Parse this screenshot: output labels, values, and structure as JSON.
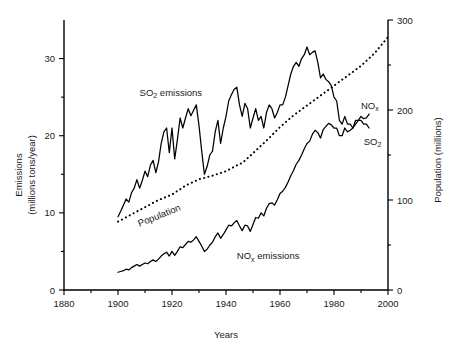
{
  "chart_data": {
    "type": "line",
    "title": "",
    "xlabel": "Years",
    "ylabel": "Emissions\n(millions tons/year)",
    "y2label": "Population (millions)",
    "xlim": [
      1880,
      2000
    ],
    "ylim": [
      0,
      35
    ],
    "y2lim": [
      0,
      300
    ],
    "grid": false,
    "legend_position": "inline-annotations",
    "x_ticks": [
      1880,
      1900,
      1920,
      1940,
      1960,
      1980,
      2000
    ],
    "x_tick_labels": [
      "1880",
      "1900",
      "1920",
      "1940",
      "1960",
      "1980",
      "2000"
    ],
    "x_minor_ticks": [
      1890,
      1910,
      1930,
      1950,
      1970,
      1990
    ],
    "y_ticks": [
      0,
      10,
      20,
      30
    ],
    "y_tick_labels": [
      "0",
      "10",
      "20",
      "30"
    ],
    "y_minor_ticks": [
      5,
      15,
      25
    ],
    "y2_ticks": [
      0,
      100,
      200,
      300
    ],
    "y2_tick_labels": [
      "0",
      "100",
      "200",
      "300"
    ],
    "y2_minor_ticks": [
      50,
      150,
      250
    ],
    "series": [
      {
        "name": "SO2 emissions",
        "label": "SO₂ emissions",
        "axis": "left",
        "style": "solid",
        "units": "millions tons/year",
        "x": [
          1900,
          1901,
          1902,
          1903,
          1904,
          1905,
          1906,
          1907,
          1908,
          1909,
          1910,
          1911,
          1912,
          1913,
          1914,
          1915,
          1916,
          1917,
          1918,
          1919,
          1920,
          1921,
          1922,
          1923,
          1924,
          1925,
          1926,
          1927,
          1928,
          1929,
          1930,
          1931,
          1932,
          1933,
          1934,
          1935,
          1936,
          1937,
          1938,
          1939,
          1940,
          1941,
          1942,
          1943,
          1944,
          1945,
          1946,
          1947,
          1948,
          1949,
          1950,
          1951,
          1952,
          1953,
          1954,
          1955,
          1956,
          1957,
          1958,
          1959,
          1960,
          1961,
          1962,
          1963,
          1964,
          1965,
          1966,
          1967,
          1968,
          1969,
          1970,
          1971,
          1972,
          1973,
          1974,
          1975,
          1976,
          1977,
          1978,
          1979,
          1980,
          1981,
          1982,
          1983,
          1984,
          1985,
          1986,
          1987,
          1988,
          1989,
          1990,
          1991,
          1992,
          1993
        ],
        "y": [
          9.5,
          10.2,
          11.0,
          11.8,
          11.4,
          12.6,
          13.2,
          14.3,
          13.2,
          14.2,
          15.4,
          14.7,
          16.2,
          16.8,
          15.2,
          16.6,
          19.0,
          20.5,
          21.0,
          17.8,
          21.0,
          17.0,
          19.5,
          22.3,
          21.0,
          22.3,
          23.5,
          22.6,
          23.3,
          24.0,
          21.3,
          18.0,
          15.0,
          16.0,
          17.5,
          18.0,
          20.5,
          22.0,
          19.0,
          21.0,
          22.5,
          24.5,
          25.3,
          26.0,
          26.3,
          24.0,
          22.5,
          24.2,
          23.5,
          21.0,
          22.3,
          23.5,
          22.0,
          22.5,
          21.0,
          23.0,
          24.0,
          23.5,
          22.3,
          23.0,
          24.0,
          24.0,
          25.0,
          26.5,
          28.0,
          29.0,
          29.5,
          29.0,
          30.0,
          30.5,
          31.5,
          30.5,
          30.8,
          31.0,
          29.5,
          27.5,
          28.0,
          27.3,
          27.0,
          26.5,
          25.0,
          24.5,
          22.0,
          21.5,
          22.5,
          21.5,
          21.5,
          21.0,
          21.5,
          22.0,
          22.0,
          21.5,
          21.5,
          21.0
        ]
      },
      {
        "name": "NOx emissions",
        "label": "NOₓ emissions",
        "axis": "left",
        "style": "solid",
        "units": "millions tons/year",
        "x": [
          1900,
          1901,
          1902,
          1903,
          1904,
          1905,
          1906,
          1907,
          1908,
          1909,
          1910,
          1911,
          1912,
          1913,
          1914,
          1915,
          1916,
          1917,
          1918,
          1919,
          1920,
          1921,
          1922,
          1923,
          1924,
          1925,
          1926,
          1927,
          1928,
          1929,
          1930,
          1931,
          1932,
          1933,
          1934,
          1935,
          1936,
          1937,
          1938,
          1939,
          1940,
          1941,
          1942,
          1943,
          1944,
          1945,
          1946,
          1947,
          1948,
          1949,
          1950,
          1951,
          1952,
          1953,
          1954,
          1955,
          1956,
          1957,
          1958,
          1959,
          1960,
          1961,
          1962,
          1963,
          1964,
          1965,
          1966,
          1967,
          1968,
          1969,
          1970,
          1971,
          1972,
          1973,
          1974,
          1975,
          1976,
          1977,
          1978,
          1979,
          1980,
          1981,
          1982,
          1983,
          1984,
          1985,
          1986,
          1987,
          1988,
          1989,
          1990,
          1991,
          1992,
          1993
        ],
        "y": [
          2.3,
          2.4,
          2.5,
          2.7,
          2.6,
          2.9,
          3.1,
          3.3,
          3.1,
          3.3,
          3.5,
          3.4,
          3.7,
          3.9,
          3.7,
          4.0,
          4.4,
          4.7,
          4.9,
          4.4,
          5.0,
          4.5,
          5.0,
          5.6,
          5.5,
          5.9,
          6.3,
          6.2,
          6.5,
          6.9,
          6.3,
          5.7,
          5.0,
          5.3,
          5.8,
          6.2,
          6.9,
          7.4,
          6.7,
          7.2,
          7.8,
          8.4,
          8.3,
          8.7,
          9.0,
          8.3,
          7.7,
          8.4,
          8.3,
          7.6,
          8.5,
          9.4,
          9.3,
          10.0,
          9.6,
          10.6,
          11.2,
          11.3,
          11.0,
          11.7,
          12.5,
          12.8,
          13.3,
          14.0,
          14.8,
          15.5,
          16.3,
          16.8,
          17.5,
          18.3,
          19.0,
          19.3,
          20.2,
          20.7,
          20.4,
          19.7,
          20.8,
          21.2,
          21.6,
          21.4,
          21.0,
          21.0,
          20.0,
          20.0,
          21.0,
          20.5,
          20.7,
          21.0,
          22.0,
          22.0,
          22.5,
          22.2,
          22.3,
          22.8
        ]
      },
      {
        "name": "Population",
        "label": "Population",
        "axis": "right",
        "style": "dotted",
        "units": "millions",
        "x": [
          1900,
          1905,
          1910,
          1915,
          1920,
          1925,
          1930,
          1935,
          1940,
          1945,
          1946,
          1950,
          1955,
          1960,
          1965,
          1970,
          1975,
          1980,
          1985,
          1990,
          1995,
          2000
        ],
        "y": [
          76,
          84,
          92,
          100,
          106,
          116,
          123,
          127,
          132,
          140,
          141,
          152,
          166,
          181,
          194,
          205,
          216,
          227,
          238,
          249,
          263,
          281
        ]
      }
    ],
    "annotations": [
      {
        "name": "so2-emissions-label",
        "text": "SO₂ emissions",
        "x": 1908,
        "y": 25.2,
        "rotation": 0
      },
      {
        "name": "population-label",
        "text": "Population",
        "x": 1908,
        "y": 8.2,
        "rotation": -22
      },
      {
        "name": "nox-emissions-label",
        "text": "NOₓ emissions",
        "x": 1944,
        "y": 4.0,
        "rotation": 0
      },
      {
        "name": "nox-end-label",
        "text": "NOₓ",
        "x": 1990,
        "y": 23.5,
        "rotation": 0
      },
      {
        "name": "so2-end-label",
        "text": "SO₂",
        "x": 1991,
        "y": 18.8,
        "rotation": 0
      }
    ]
  }
}
